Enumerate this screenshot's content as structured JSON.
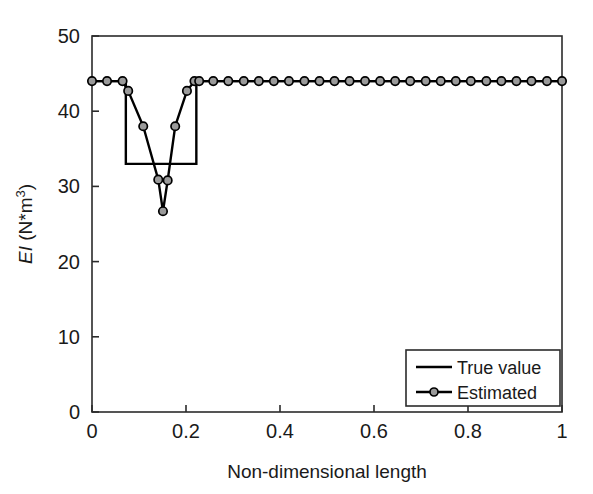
{
  "chart_data": {
    "type": "line",
    "title": "",
    "xlabel": "Non-dimensional length",
    "ylabel": "EI (N*m3)",
    "ylabel_parts": {
      "italic": "EI",
      "rest": " (N*m",
      "superscript": "3",
      "close": ")"
    },
    "xlim": [
      0,
      1
    ],
    "ylim": [
      0,
      50
    ],
    "xticks": [
      0,
      0.2,
      0.4,
      0.6,
      0.8,
      1
    ],
    "xtick_labels": [
      "0",
      "0.2",
      "0.4",
      "0.6",
      "0.8",
      "1"
    ],
    "yticks": [
      0,
      10,
      20,
      30,
      40,
      50
    ],
    "ytick_labels": [
      "0",
      "10",
      "20",
      "30",
      "40",
      "50"
    ],
    "grid": false,
    "legend_position": "lower right",
    "series": [
      {
        "name": "True value",
        "style": "step",
        "marker": "none",
        "color": "#000000",
        "x": [
          0,
          0.072,
          0.072,
          0.222,
          0.222,
          1
        ],
        "y": [
          44,
          44,
          33,
          33,
          44,
          44
        ]
      },
      {
        "name": "Estimated",
        "style": "line",
        "marker": "circle",
        "color": "#000000",
        "marker_face": "#9a9a9a",
        "x": [
          0,
          0.032,
          0.065,
          0.077,
          0.109,
          0.141,
          0.151,
          0.161,
          0.177,
          0.202,
          0.218,
          0.228,
          0.258,
          0.29,
          0.323,
          0.355,
          0.387,
          0.419,
          0.452,
          0.484,
          0.516,
          0.548,
          0.581,
          0.613,
          0.645,
          0.677,
          0.71,
          0.742,
          0.774,
          0.806,
          0.839,
          0.871,
          0.903,
          0.935,
          0.968,
          1
        ],
        "y": [
          44,
          44,
          44,
          42.7,
          38,
          30.9,
          26.7,
          30.8,
          38,
          42.7,
          44,
          44,
          44,
          44,
          44,
          44,
          44,
          44,
          44,
          44,
          44,
          44,
          44,
          44,
          44,
          44,
          44,
          44,
          44,
          44,
          44,
          44,
          44,
          44,
          44,
          44
        ]
      }
    ],
    "legend": [
      {
        "label": "True value",
        "marker": "none"
      },
      {
        "label": "Estimated",
        "marker": "circle"
      }
    ]
  },
  "axes": {
    "x_title": "Non-dimensional length",
    "y_title_italic": "EI",
    "y_title_rest": " (N*m",
    "y_title_sup": "3",
    "y_title_close": ")"
  },
  "legend": {
    "true_value_label": "True value",
    "estimated_label": "Estimated"
  },
  "colors": {
    "axis": "#2b2b2b",
    "line": "#000000",
    "marker_face": "#9a9a9a",
    "background": "#ffffff"
  }
}
